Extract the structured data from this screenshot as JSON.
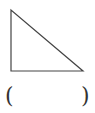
{
  "figure": {
    "shape": "right-triangle",
    "stroke_color": "#444444",
    "vertices": [
      [
        11,
        10
      ],
      [
        11,
        71
      ],
      [
        83,
        71
      ]
    ]
  },
  "answer_blank": {
    "left_paren": "(",
    "right_paren": ")",
    "value": ""
  }
}
